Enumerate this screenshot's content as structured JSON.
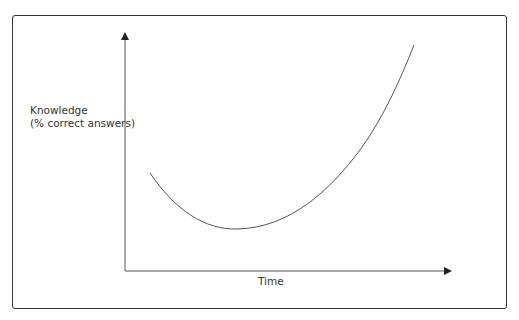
{
  "diagram": {
    "y_axis_label_line1": "Knowledge",
    "y_axis_label_line2": "(% correct answers)",
    "x_axis_label": "Time",
    "curve_description": "U-shaped curve: starts moderate, dips to minimum, then rises steeply",
    "colors": {
      "axis": "#333333",
      "curve": "#555555",
      "frame": "#333333"
    }
  }
}
